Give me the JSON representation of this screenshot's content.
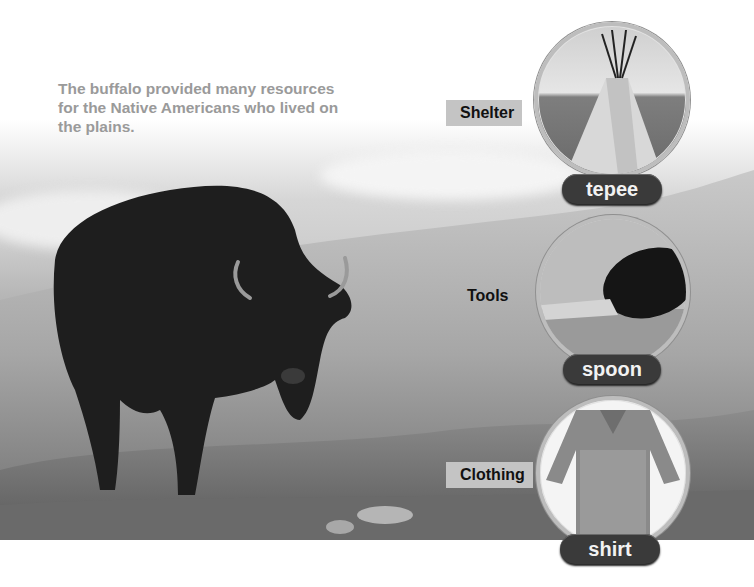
{
  "page": {
    "caption": "The buffalo provided many resources for the Native Americans who lived on the plains.",
    "main_image": "buffalo standing in prairie grass"
  },
  "resources": [
    {
      "category": "Shelter",
      "item": "tepee",
      "image": "tepee on plains"
    },
    {
      "category": "Tools",
      "item": "spoon",
      "image": "horn spoon"
    },
    {
      "category": "Clothing",
      "item": "shirt",
      "image": "fringed hide shirt"
    }
  ],
  "colors": {
    "caption_text": "#9a9a9a",
    "label_box_bg": "#c4c4c4",
    "pill_bg": "#3a3a3a",
    "pill_text": "#f2f2f2"
  }
}
